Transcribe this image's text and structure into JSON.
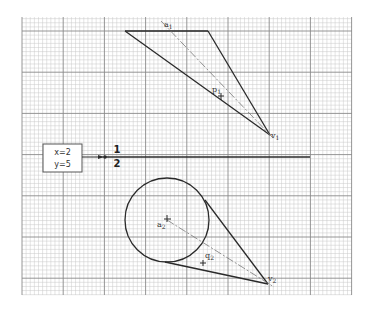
{
  "diagram": {
    "type": "projection-drawing-on-grid",
    "colors": {
      "grid_minor": "#c8c8c8",
      "grid_major": "#8a8a8a",
      "stroke": "#2a2a2a",
      "axis_dashed": "#777777"
    },
    "grid": {
      "x0": 22,
      "y0": 17,
      "x1": 352,
      "y1": 295,
      "minor": 4.12,
      "major_every": 10
    },
    "view1": {
      "labels": {
        "apex_axis": "a",
        "apex_axis_sub": "1",
        "point": "p",
        "point_sub": "1",
        "vertex": "v",
        "vertex_sub": "1"
      }
    },
    "view2": {
      "labels": {
        "center": "a",
        "center_sub": "2",
        "point": "q",
        "point_sub": "2",
        "vertex": "v",
        "vertex_sub": "2"
      }
    },
    "coord_box": {
      "line1": "x=2",
      "line2": "y=5"
    },
    "ground_line": {
      "upper_label": "1",
      "lower_label": "2"
    }
  }
}
